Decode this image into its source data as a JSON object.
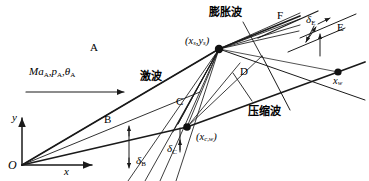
{
  "figure": {
    "kind": "technical-line-diagram",
    "background_color": "#ffffff",
    "line_color": "#1a1a1a",
    "text_color": "#000000"
  },
  "axes": {
    "origin_label": "O",
    "x_axis_label": "x",
    "y_axis_label": "y"
  },
  "inflow": {
    "label_mach": "Ma",
    "label_mach_sub": "A",
    "label_pressure": "p",
    "label_pressure_sub": "A",
    "label_angle": "θ",
    "label_angle_sub": "A",
    "full_text": "MaA,pA,θA",
    "arrow": "rightwards-arrow"
  },
  "regions": [
    {
      "id": "A",
      "label": "A"
    },
    {
      "id": "B",
      "label": "B"
    },
    {
      "id": "C",
      "label": "C"
    },
    {
      "id": "D",
      "label": "D"
    },
    {
      "id": "E",
      "label": "E"
    },
    {
      "id": "F",
      "label": "F"
    }
  ],
  "wave_labels": [
    {
      "id": "shock",
      "label": "激波",
      "meaning": "shock wave"
    },
    {
      "id": "expansion",
      "label": "膨胀波",
      "meaning": "expansion wave"
    },
    {
      "id": "compression",
      "label": "压缩波",
      "meaning": "compression wave"
    }
  ],
  "points": [
    {
      "id": "shock-point",
      "label": "(xs,ys)",
      "main": "(x",
      "sub1": "s",
      "mid": ",y",
      "sub2": "s",
      "close": ")"
    },
    {
      "id": "compression-point",
      "label": "(xc,w)",
      "main": "(x",
      "sub1": "c,w",
      "close": ")"
    },
    {
      "id": "wall-point",
      "label": "xw",
      "main": "x",
      "sub1": "w"
    }
  ],
  "deflection_angles": [
    {
      "id": "delta-B",
      "symbol": "δ",
      "sub": "B"
    },
    {
      "id": "delta-C",
      "symbol": "δ",
      "sub": "C"
    },
    {
      "id": "delta-E",
      "symbol": "δ",
      "sub": "E"
    }
  ]
}
